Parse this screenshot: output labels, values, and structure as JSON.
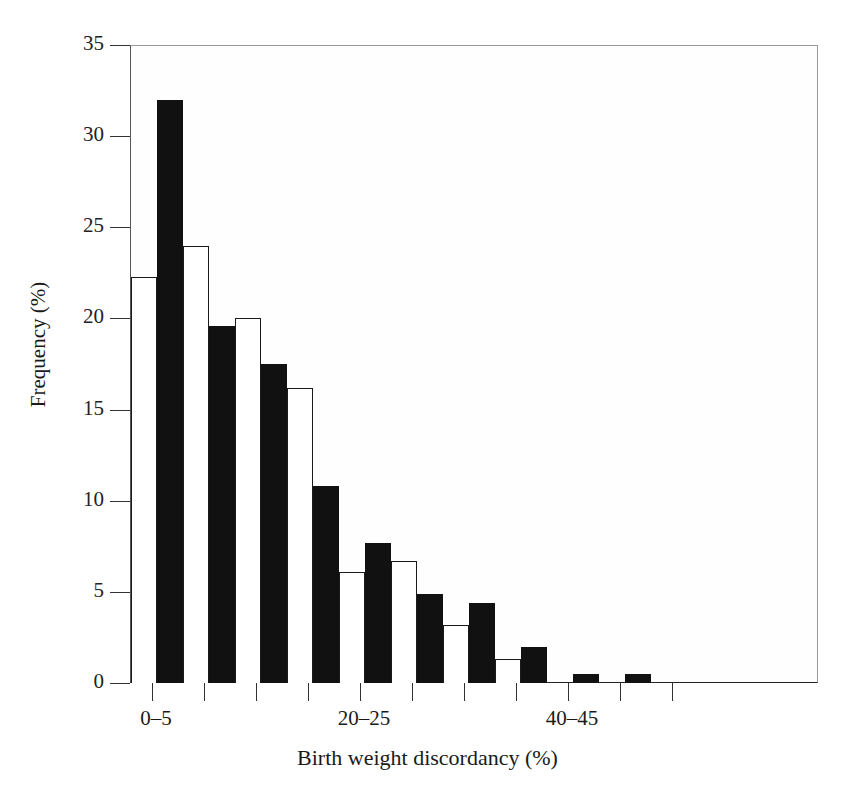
{
  "figure": {
    "axis_title_x": "Birth weight discordancy (%)",
    "axis_title_y": "Frequency (%)",
    "ink_color": "#111111",
    "frame_color": "#555555"
  },
  "chart_data": {
    "type": "bar",
    "title": "",
    "subtitle": "",
    "xlabel": "Birth weight discordancy (%)",
    "ylabel": "Frequency (%)",
    "ylim": [
      0,
      35
    ],
    "ytick_values": [
      0,
      5,
      10,
      15,
      20,
      25,
      30,
      35
    ],
    "ytick_labels": [
      "0",
      "5",
      "10",
      "15",
      "20",
      "25",
      "30",
      "35"
    ],
    "grid": false,
    "legend": null,
    "categories": [
      "0–5",
      "5–10",
      "10–15",
      "15–20",
      "20–25",
      "25–30",
      "30–35",
      "35–40",
      "40–45",
      "45–50"
    ],
    "xtick_labels_shown": [
      {
        "category_index": 0,
        "label": "0–5"
      },
      {
        "category_index": 4,
        "label": "20–25"
      },
      {
        "category_index": 8,
        "label": "40–45"
      }
    ],
    "series": [
      {
        "name": "white",
        "fill": "#ffffff",
        "edge": "#1a1a1a",
        "values": [
          22.3,
          24.0,
          20.0,
          16.2,
          6.1,
          6.7,
          3.2,
          1.3,
          0.0,
          0.0
        ]
      },
      {
        "name": "black",
        "fill": "#111111",
        "edge": "#111111",
        "values": [
          32.0,
          19.6,
          17.5,
          10.8,
          7.7,
          4.9,
          4.4,
          2.0,
          0.5,
          0.5
        ]
      }
    ]
  }
}
